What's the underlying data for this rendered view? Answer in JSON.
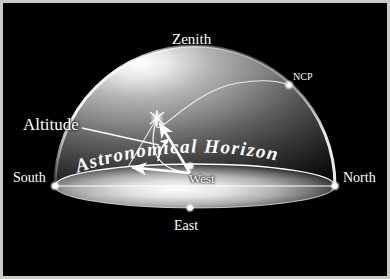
{
  "figure": {
    "background_color": "#000000",
    "frame_color": "#c9c9c5",
    "line_color": "#ffffff"
  },
  "labels": {
    "zenith": "Zenith",
    "ncp": "NCP",
    "altitude": "Altitude",
    "south": "South",
    "north": "North",
    "west": "West",
    "east": "East",
    "horizon": "Astronomical Horizon"
  },
  "horizon_text_letters": [
    "A",
    "s",
    "t",
    "r",
    "o",
    "n",
    "o",
    "m",
    "i",
    "c",
    "a",
    "l",
    " ",
    "H",
    "o",
    "r",
    "i",
    "z",
    "o",
    "n"
  ],
  "markers": [
    {
      "name": "south-point",
      "x": 55,
      "y": 186
    },
    {
      "name": "north-point",
      "x": 335,
      "y": 186
    },
    {
      "name": "west-point",
      "x": 190,
      "y": 166
    },
    {
      "name": "east-point",
      "x": 190,
      "y": 208
    },
    {
      "name": "ncp-point",
      "x": 289,
      "y": 85
    },
    {
      "name": "star-point",
      "x": 157,
      "y": 118
    }
  ],
  "geometry": {
    "dome_center_x": 195,
    "dome_center_y": 186,
    "dome_radius_x": 140,
    "dome_radius_y": 140,
    "horizon_ellipse_rx": 140,
    "horizon_ellipse_ry": 22,
    "observer_x": 190,
    "observer_y": 173,
    "altitude_foot_x": 128,
    "altitude_foot_y": 167
  }
}
